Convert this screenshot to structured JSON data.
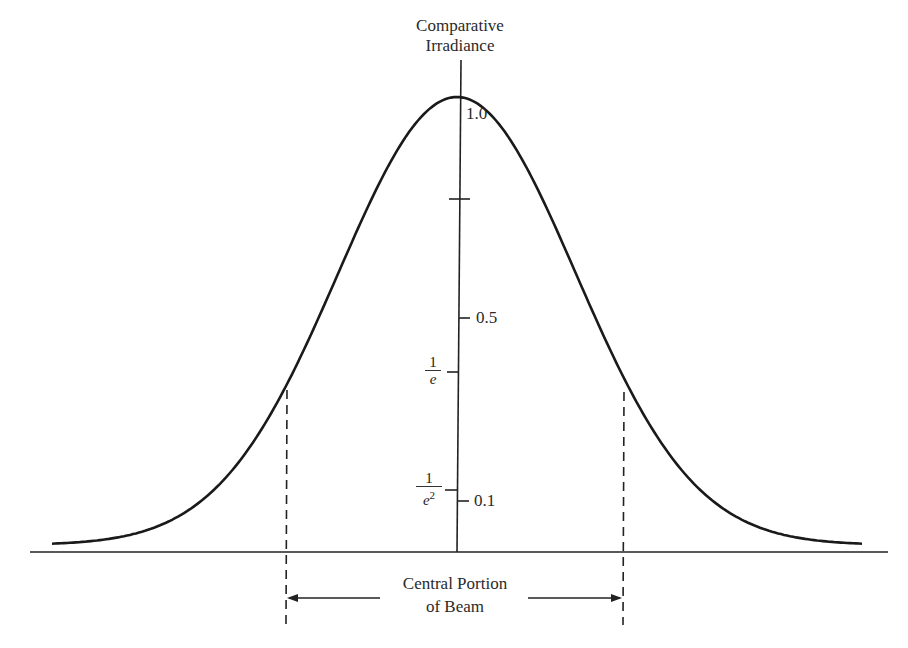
{
  "diagram": {
    "y_axis_title_line1": "Comparative",
    "y_axis_title_line2": "Irradiance",
    "tick_labels": {
      "peak": "1.0",
      "half": "0.5",
      "one_tenth": "0.1",
      "inv_e_num": "1",
      "inv_e_den": "e",
      "inv_e2_num": "1",
      "inv_e2_den": "e",
      "inv_e2_exp": "2"
    },
    "span_label_line1": "Central Portion",
    "span_label_line2": "of Beam",
    "curve": {
      "type": "gaussian",
      "description": "Gaussian beam irradiance profile with dashed markers at 1/e points"
    }
  }
}
